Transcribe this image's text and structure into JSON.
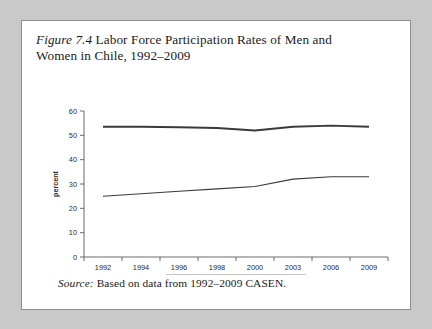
{
  "figure": {
    "label": "Figure 7.4",
    "title": " Labor Force Participation Rates of Men and Women in Chile, 1992–2009",
    "source_label": "Source:",
    "source_text": " Based on data from 1992–2009 CASEN."
  },
  "chart_data": {
    "type": "line",
    "title": "",
    "xlabel": "",
    "ylabel": "percent",
    "categories": [
      "1992",
      "1994",
      "1996",
      "1998",
      "2000",
      "2003",
      "2006",
      "2009"
    ],
    "series": [
      {
        "name": "women",
        "values": [
          25,
          26,
          27,
          28,
          29,
          32,
          33,
          33
        ]
      },
      {
        "name": "men",
        "values": [
          53.5,
          53.5,
          53.3,
          53,
          52,
          53.5,
          54,
          53.5
        ]
      }
    ],
    "ylim": [
      0,
      60
    ],
    "yticks": [
      0,
      10,
      20,
      30,
      40,
      50,
      60
    ],
    "ytick_labels": [
      "0",
      "10",
      "20",
      "30",
      "40",
      "50",
      "60"
    ],
    "grid": false,
    "legend_position": "bottom",
    "legend": [
      "women",
      "men"
    ]
  }
}
